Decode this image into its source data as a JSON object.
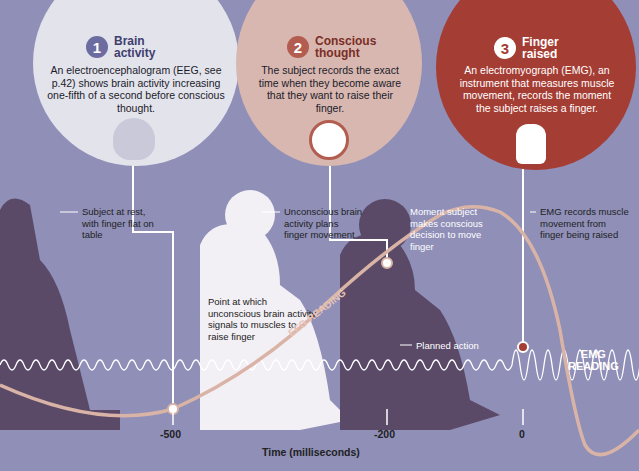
{
  "steps": [
    {
      "number": "1",
      "title_line1": "Brain",
      "title_line2": "activity",
      "description": "An electroencephalogram (EEG, see p.42) shows brain activity increasing one-fifth of a second before conscious thought.",
      "icon": "brain-eeg-icon"
    },
    {
      "number": "2",
      "title_line1": "Conscious",
      "title_line2": "thought",
      "description": "The subject records the exact time when they become aware that they want to raise their finger.",
      "icon": "clock-head-icon"
    },
    {
      "number": "3",
      "title_line1": "Finger",
      "title_line2": "raised",
      "description": "An electromyograph (EMG), an instrument that measures muscle movement, records the moment the subject raises a finger.",
      "icon": "raised-finger-icon"
    }
  ],
  "labels": {
    "rest": "Subject at rest, with finger flat on table",
    "unconscious": "Unconscious brain activity plans finger movement",
    "signal_point": "Point at which unconscious brain activity signals to muscles to raise finger",
    "conscious_decision": "Moment subject makes conscious decision to move finger",
    "planned_action": "Planned action",
    "emg_records": "EMG records muscle movement from finger being raised"
  },
  "readings": {
    "eeg": "EEG READING",
    "emg_line1": "EMG",
    "emg_line2": "READING"
  },
  "axis": {
    "title": "Time (milliseconds)",
    "ticks": [
      "-500",
      "-200",
      "0"
    ]
  },
  "colors": {
    "background": "#8f8fb8",
    "eeg_curve": "#d9b4a6",
    "emg_curve": "#ffffff",
    "step1": "#6c6ca0",
    "step2": "#b25d4f",
    "step3": "#a43d34"
  }
}
